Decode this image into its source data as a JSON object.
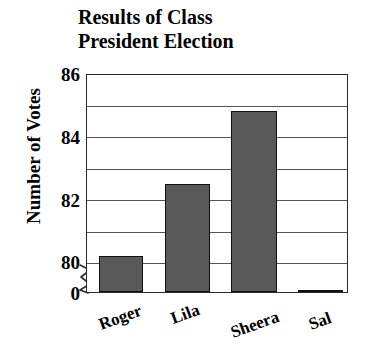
{
  "chart_data": {
    "type": "bar",
    "title_line1": "Results of Class",
    "title_line2": "President Election",
    "xlabel": "",
    "ylabel": "Number of Votes",
    "categories": [
      "Roger",
      "Lila",
      "Sheera",
      "Sal"
    ],
    "values": [
      81,
      83,
      85,
      80
    ],
    "ylim": [
      80,
      86
    ],
    "y_tick_values": [
      86,
      84,
      82,
      80,
      0
    ],
    "y_tick_labels": [
      "86",
      "84",
      "82",
      "80",
      "0"
    ],
    "y_minor_tick_step": 0.5,
    "grid": true,
    "grid_axis": "y",
    "axis_break": true,
    "axis_break_between": [
      0,
      80
    ],
    "legend": null,
    "bar_color": "#595959",
    "bar_edge_color": "#111111",
    "gridline_color": "#555555",
    "axis_color": "#2a2a2a",
    "background_color": "#ffffff",
    "x_tick_label_rotation": -20
  },
  "chart": {
    "title_line1": "Results of Class",
    "title_line2": "President Election",
    "y_axis_title": "Number of Votes",
    "y_ticks": [
      {
        "label": "86",
        "value": 86
      },
      {
        "label": "84",
        "value": 84
      },
      {
        "label": "82",
        "value": 82
      },
      {
        "label": "80",
        "value": 80
      },
      {
        "label": "0",
        "value": 0
      }
    ],
    "bars": [
      {
        "label": "Roger",
        "value": 81
      },
      {
        "label": "Lila",
        "value": 83
      },
      {
        "label": "Sheera",
        "value": 85
      },
      {
        "label": "Sal",
        "value": 80
      }
    ]
  }
}
